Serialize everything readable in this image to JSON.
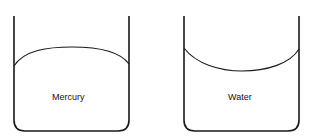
{
  "diagram": {
    "tubes": [
      {
        "label": "Mercury",
        "meniscus": "convex"
      },
      {
        "label": "Water",
        "meniscus": "concave"
      }
    ],
    "stroke_color": "#1a1a1a"
  }
}
